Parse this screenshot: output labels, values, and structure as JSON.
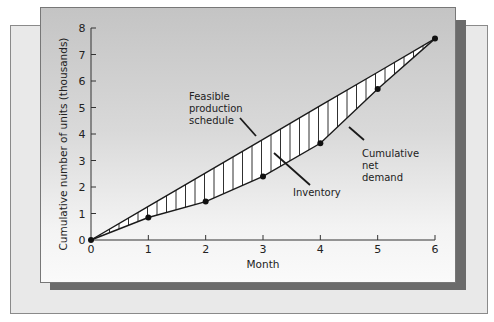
{
  "chart_data": {
    "type": "line",
    "title": "",
    "xlabel": "Month",
    "ylabel": "Cumulative number of units (thousands)",
    "x": [
      0,
      1,
      2,
      3,
      4,
      5,
      6
    ],
    "xticks": [
      "0",
      "1",
      "2",
      "3",
      "4",
      "5",
      "6"
    ],
    "yticks": [
      "0",
      "1",
      "2",
      "3",
      "4",
      "5",
      "6",
      "7",
      "8"
    ],
    "xlim": [
      0,
      6
    ],
    "ylim": [
      0,
      8
    ],
    "grid": false,
    "legend": "none",
    "series": [
      {
        "name": "Feasible production schedule",
        "style": "straight line",
        "values": [
          0,
          1.27,
          2.53,
          3.8,
          5.07,
          6.33,
          7.6
        ]
      },
      {
        "name": "Cumulative net demand",
        "style": "line with markers",
        "values": [
          0,
          0.85,
          1.45,
          2.4,
          3.65,
          5.7,
          7.6
        ]
      }
    ],
    "shaded_region": {
      "name": "Inventory",
      "between": [
        "Feasible production schedule",
        "Cumulative net demand"
      ],
      "pattern": "vertical hatching"
    },
    "annotations": [
      {
        "text": [
          "Feasible",
          "production",
          "schedule"
        ],
        "points_to": "Feasible production schedule"
      },
      {
        "text": [
          "Inventory"
        ],
        "points_to": "Inventory"
      },
      {
        "text": [
          "Cumulative",
          "net",
          "demand"
        ],
        "points_to": "Cumulative net demand"
      }
    ]
  },
  "labels": {
    "xlabel": "Month",
    "ylabel": "Cumulative number of units (thousands)",
    "annot_feasible": [
      "Feasible",
      "production",
      "schedule"
    ],
    "annot_inventory": "Inventory",
    "annot_demand": [
      "Cumulative",
      "net",
      "demand"
    ]
  },
  "colors": {
    "back_panel": "#e9e9e9",
    "front_panel_top": "#c4c4c4",
    "front_panel_bottom": "#fafafa",
    "shadow": "#6b6b6b",
    "line": "#1a1a1a",
    "hatch_fill": "#ffffff"
  }
}
